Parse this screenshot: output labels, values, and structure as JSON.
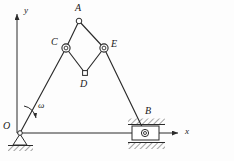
{
  "figure": {
    "background": "#fdfdfd",
    "stroke_color": "#2b2b2b",
    "label_color": "#1a1a1a"
  },
  "axes": {
    "origin_label": "O",
    "x_label": "x",
    "y_label": "y",
    "x_axis": {
      "x1": 17,
      "y1": 133,
      "x2": 180,
      "y2": 133
    },
    "y_axis": {
      "x1": 17,
      "y1": 133,
      "x2": 17,
      "y2": 12
    }
  },
  "angular_velocity": {
    "symbol": "ω",
    "label_x": 39,
    "label_y": 103
  },
  "joints": [
    {
      "name": "A",
      "type": "pin-small",
      "x": 79,
      "y": 21,
      "label": "A",
      "label_x": 75,
      "label_y": 4
    },
    {
      "name": "C",
      "type": "pin-double",
      "x": 66,
      "y": 48,
      "label": "C",
      "label_x": 52,
      "label_y": 40
    },
    {
      "name": "E",
      "type": "pin-double",
      "x": 104,
      "y": 48,
      "label": "E",
      "label_x": 112,
      "label_y": 41
    },
    {
      "name": "D",
      "type": "pin-small",
      "x": 85,
      "y": 73,
      "label": "D",
      "label_x": 80,
      "label_y": 80
    },
    {
      "name": "B",
      "type": "slider",
      "x": 145,
      "y": 133,
      "label": "B",
      "label_x": 146,
      "label_y": 110
    },
    {
      "name": "O",
      "type": "pin-support",
      "x": 20,
      "y": 133,
      "label": "O",
      "label_x": 4,
      "label_y": 122
    }
  ],
  "links": [
    {
      "name": "link-O-C",
      "from": "O",
      "to": "C"
    },
    {
      "name": "link-C-A",
      "from": "C",
      "to": "A"
    },
    {
      "name": "link-A-E",
      "from": "A",
      "to": "E"
    },
    {
      "name": "link-C-D",
      "from": "C",
      "to": "D"
    },
    {
      "name": "link-D-E",
      "from": "D",
      "to": "E"
    },
    {
      "name": "link-E-B",
      "from": "E",
      "to": "B"
    }
  ],
  "supports": {
    "ground_pin": {
      "name": "pin-support-O",
      "hatch_x1": 8,
      "hatch_x2": 36,
      "hatch_y": 146
    },
    "slider_guide": {
      "name": "slider-guide-B",
      "block_x": 131,
      "block_y": 125,
      "block_w": 29,
      "block_h": 16,
      "hatch_top_y": 122,
      "hatch_bottom_y": 148,
      "hatch_x1": 128,
      "hatch_x2": 165
    }
  }
}
